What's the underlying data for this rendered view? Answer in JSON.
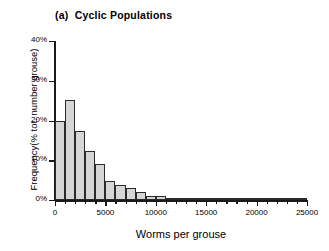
{
  "figure": {
    "panel_label": "(a)",
    "panel_title": "Cyclic Populations"
  },
  "chart_data": {
    "type": "bar",
    "xlabel": "Worms per grouse",
    "ylabel": "Frequency(% tot. number grouse)",
    "xlim": [
      0,
      25000
    ],
    "ylim": [
      0,
      40
    ],
    "grid": false,
    "legend": null,
    "bin_width": 1000,
    "x_tick_labels": [
      "0",
      "5000",
      "10000",
      "15000",
      "20000",
      "25000"
    ],
    "x_tick_values": [
      0,
      5000,
      10000,
      15000,
      20000,
      25000
    ],
    "x_minor_tick_step": 1000,
    "y_tick_labels": [
      "0%",
      "10%",
      "20%",
      "30%",
      "40%"
    ],
    "y_tick_values": [
      0,
      10,
      20,
      30,
      40
    ],
    "bin_starts": [
      0,
      1000,
      2000,
      3000,
      4000,
      5000,
      6000,
      7000,
      8000,
      9000,
      10000,
      11000,
      12000,
      13000,
      14000,
      15000,
      16000,
      17000,
      18000,
      19000,
      20000,
      21000,
      22000,
      23000,
      24000
    ],
    "values": [
      19.8,
      25.2,
      17.4,
      12.4,
      9.0,
      4.8,
      3.9,
      3.0,
      1.9,
      1.1,
      0.9,
      0.5,
      0.2,
      0.5,
      0.1,
      0.1,
      0.1,
      0.1,
      0.1,
      0.1,
      0.1,
      0.1,
      0.1,
      0.1,
      0.1
    ],
    "units": "% of total number of grouse"
  },
  "style": {
    "bar_fill": "#d6d6d6",
    "bar_edge": "#2b2b2b",
    "axis_color": "#1a1a1a",
    "background": "#ffffff"
  }
}
